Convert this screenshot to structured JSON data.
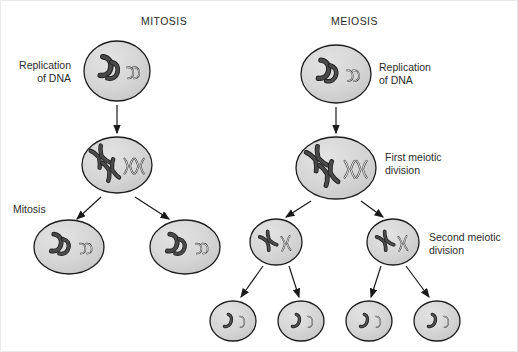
{
  "figure": {
    "kind": "biology-diagram",
    "background_color": "#ffffff",
    "frame_color": "#e9e9e9"
  },
  "palette": {
    "cell_fill": "#d4d4d4",
    "cell_stroke": "#1d1d1d",
    "cell_highlight": "#e6e6e6",
    "chromosome_dark": "#4a4a4a",
    "chromosome_dark_stroke": "#1d1d1d",
    "chromosome_light": "#e2e2e2",
    "chromosome_light_stroke": "#3a3a3a",
    "arrow_color": "#1a1a1a",
    "text_color": "#2b2b2b"
  },
  "columns": [
    {
      "id": "mitosis",
      "title": "MITOSIS",
      "title_x": 140,
      "title_y": 14
    },
    {
      "id": "meiosis",
      "title": "MEIOSIS",
      "title_x": 330,
      "title_y": 14
    }
  ],
  "labels": [
    {
      "id": "mitosis-replication",
      "text": "Replication\nof DNA",
      "align": "right",
      "x": 4,
      "y": 58,
      "width": 66,
      "column": "mitosis"
    },
    {
      "id": "mitosis-division",
      "text": "Mitosis",
      "align": "left",
      "x": 12,
      "y": 202,
      "width": 60,
      "column": "mitosis"
    },
    {
      "id": "meiosis-replication",
      "text": "Replication\nof DNA",
      "align": "left",
      "x": 378,
      "y": 60,
      "width": 84,
      "column": "meiosis"
    },
    {
      "id": "meiosis-first",
      "text": "First meiotic\ndivision",
      "align": "left",
      "x": 384,
      "y": 150,
      "width": 86,
      "column": "meiosis"
    },
    {
      "id": "meiosis-second",
      "text": "Second meiotic\ndivision",
      "align": "left",
      "x": 428,
      "y": 230,
      "width": 92,
      "column": "meiosis"
    }
  ],
  "cells": [
    {
      "id": "mit-parent",
      "column": "mitosis",
      "stage": "replication",
      "cx": 116,
      "cy": 70,
      "rx": 33,
      "ry": 30,
      "dark": "pair-unreplicated",
      "light": "pair-unreplicated"
    },
    {
      "id": "mit-replicated",
      "column": "mitosis",
      "stage": "after-replication",
      "cx": 116,
      "cy": 164,
      "rx": 35,
      "ry": 28,
      "dark": "pair-replicated",
      "light": "pair-replicated"
    },
    {
      "id": "mit-daughter-1",
      "column": "mitosis",
      "stage": "daughter",
      "cx": 68,
      "cy": 246,
      "rx": 35,
      "ry": 27,
      "dark": "pair-unreplicated",
      "light": "pair-unreplicated"
    },
    {
      "id": "mit-daughter-2",
      "column": "mitosis",
      "stage": "daughter",
      "cx": 184,
      "cy": 246,
      "rx": 35,
      "ry": 27,
      "dark": "pair-unreplicated",
      "light": "pair-unreplicated"
    },
    {
      "id": "mei-parent",
      "column": "meiosis",
      "stage": "replication",
      "cx": 335,
      "cy": 73,
      "rx": 35,
      "ry": 29,
      "dark": "pair-unreplicated",
      "light": "pair-unreplicated"
    },
    {
      "id": "mei-first",
      "column": "meiosis",
      "stage": "first-division",
      "cx": 335,
      "cy": 167,
      "rx": 40,
      "ry": 31,
      "dark": "pair-replicated",
      "light": "pair-replicated"
    },
    {
      "id": "mei-second-l",
      "column": "meiosis",
      "stage": "second-division",
      "cx": 275,
      "cy": 241,
      "rx": 26,
      "ry": 23,
      "dark": "single-replicated",
      "light": "single-replicated"
    },
    {
      "id": "mei-second-r",
      "column": "meiosis",
      "stage": "second-division",
      "cx": 392,
      "cy": 241,
      "rx": 26,
      "ry": 23,
      "dark": "single-replicated",
      "light": "single-replicated"
    },
    {
      "id": "mei-gamete-1",
      "column": "meiosis",
      "stage": "gamete",
      "cx": 232,
      "cy": 320,
      "rx": 23,
      "ry": 20,
      "dark": "single-chromatid",
      "light": "single-chromatid"
    },
    {
      "id": "mei-gamete-2",
      "column": "meiosis",
      "stage": "gamete",
      "cx": 300,
      "cy": 320,
      "rx": 23,
      "ry": 20,
      "dark": "single-chromatid",
      "light": "single-chromatid"
    },
    {
      "id": "mei-gamete-3",
      "column": "meiosis",
      "stage": "gamete",
      "cx": 368,
      "cy": 320,
      "rx": 23,
      "ry": 20,
      "dark": "single-chromatid",
      "light": "single-chromatid"
    },
    {
      "id": "mei-gamete-4",
      "column": "meiosis",
      "stage": "gamete",
      "cx": 436,
      "cy": 320,
      "rx": 23,
      "ry": 20,
      "dark": "single-chromatid",
      "light": "single-chromatid"
    }
  ],
  "arrows": [
    {
      "id": "mit-a1",
      "from": "mit-parent",
      "to": "mit-replicated",
      "x1": 116,
      "y1": 104,
      "x2": 116,
      "y2": 132
    },
    {
      "id": "mit-a2",
      "from": "mit-replicated",
      "to": "mit-daughter-1",
      "x1": 100,
      "y1": 196,
      "x2": 76,
      "y2": 218
    },
    {
      "id": "mit-a3",
      "from": "mit-replicated",
      "to": "mit-daughter-2",
      "x1": 134,
      "y1": 196,
      "x2": 168,
      "y2": 218
    },
    {
      "id": "mei-a1",
      "from": "mei-parent",
      "to": "mei-first",
      "x1": 335,
      "y1": 106,
      "x2": 335,
      "y2": 132
    },
    {
      "id": "mei-a2",
      "from": "mei-first",
      "to": "mei-second-l",
      "x1": 310,
      "y1": 200,
      "x2": 285,
      "y2": 216
    },
    {
      "id": "mei-a3",
      "from": "mei-first",
      "to": "mei-second-r",
      "x1": 360,
      "y1": 200,
      "x2": 382,
      "y2": 216
    },
    {
      "id": "mei-a4",
      "from": "mei-second-l",
      "to": "mei-gamete-1",
      "x1": 262,
      "y1": 265,
      "x2": 240,
      "y2": 296
    },
    {
      "id": "mei-a5",
      "from": "mei-second-l",
      "to": "mei-gamete-2",
      "x1": 288,
      "y1": 265,
      "x2": 298,
      "y2": 296
    },
    {
      "id": "mei-a6",
      "from": "mei-second-r",
      "to": "mei-gamete-3",
      "x1": 380,
      "y1": 265,
      "x2": 370,
      "y2": 296
    },
    {
      "id": "mei-a7",
      "from": "mei-second-r",
      "to": "mei-gamete-4",
      "x1": 405,
      "y1": 265,
      "x2": 428,
      "y2": 296
    }
  ]
}
